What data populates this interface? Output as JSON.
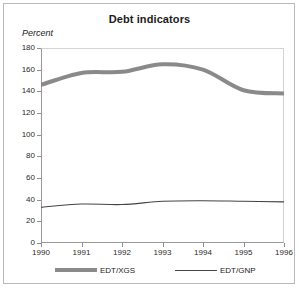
{
  "chart_data": {
    "type": "line",
    "title": "Debt indicators",
    "ylabel": "Percent",
    "xlabel": "",
    "ylim": [
      0,
      180
    ],
    "yticks": [
      0,
      20,
      40,
      60,
      80,
      100,
      120,
      140,
      160,
      180
    ],
    "x": [
      1990,
      1991,
      1992,
      1993,
      1994,
      1995,
      1996
    ],
    "xticks": [
      "1990",
      "1991",
      "1992",
      "1993",
      "1994",
      "1995",
      "1996"
    ],
    "grid": false,
    "legend_position": "bottom",
    "series": [
      {
        "name": "EDT/XGS",
        "color": "#8a8a8a",
        "style": "thick",
        "values": [
          146,
          157,
          158,
          165,
          160,
          141,
          138
        ]
      },
      {
        "name": "EDT/GNP",
        "color": "#444444",
        "style": "thin",
        "values": [
          33,
          36,
          35.5,
          38.5,
          39,
          38.5,
          38
        ]
      }
    ]
  },
  "legend": {
    "entries": [
      {
        "label": "EDT/XGS"
      },
      {
        "label": "EDT/GNP"
      }
    ]
  }
}
